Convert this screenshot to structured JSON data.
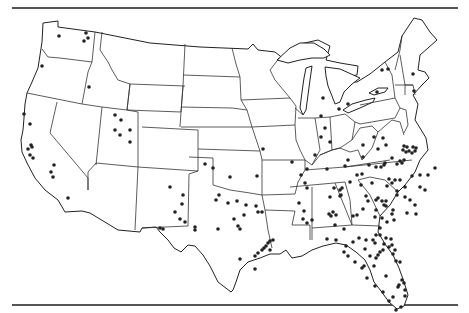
{
  "figure": {
    "type": "dot-distribution map",
    "region": "Contiguous United States",
    "marker_color": "#222222",
    "line_color": "#333333",
    "background": "#ffffff"
  },
  "points": [
    [
      59,
      36
    ],
    [
      86,
      33
    ],
    [
      88,
      38
    ],
    [
      84,
      41
    ],
    [
      42,
      66
    ],
    [
      89,
      87
    ],
    [
      24,
      114
    ],
    [
      30,
      124
    ],
    [
      31,
      145
    ],
    [
      28,
      149
    ],
    [
      32,
      147
    ],
    [
      30,
      155
    ],
    [
      33,
      158
    ],
    [
      54,
      165
    ],
    [
      51,
      172
    ],
    [
      53,
      177
    ],
    [
      68,
      198
    ],
    [
      115,
      115
    ],
    [
      121,
      120
    ],
    [
      115,
      130
    ],
    [
      120,
      135
    ],
    [
      130,
      130
    ],
    [
      130,
      142
    ],
    [
      170,
      187
    ],
    [
      183,
      195
    ],
    [
      182,
      204
    ],
    [
      175,
      212
    ],
    [
      180,
      219
    ],
    [
      163,
      229
    ],
    [
      160,
      228
    ],
    [
      205,
      164
    ],
    [
      213,
      168
    ],
    [
      230,
      177
    ],
    [
      219,
      195
    ],
    [
      216,
      200
    ],
    [
      228,
      203
    ],
    [
      237,
      201
    ],
    [
      246,
      205
    ],
    [
      256,
      206
    ],
    [
      234,
      219
    ],
    [
      244,
      215
    ],
    [
      258,
      212
    ],
    [
      262,
      212
    ],
    [
      238,
      226
    ],
    [
      240,
      229
    ],
    [
      240,
      259
    ],
    [
      255,
      256
    ],
    [
      258,
      253
    ],
    [
      262,
      250
    ],
    [
      264,
      248
    ],
    [
      266,
      246
    ],
    [
      268,
      243
    ],
    [
      270,
      241
    ],
    [
      273,
      240
    ],
    [
      270,
      250
    ],
    [
      255,
      269
    ],
    [
      195,
      230
    ],
    [
      185,
      222
    ],
    [
      195,
      227
    ],
    [
      218,
      229
    ],
    [
      263,
      149
    ],
    [
      257,
      176
    ],
    [
      307,
      169
    ],
    [
      307,
      188
    ],
    [
      299,
      203
    ],
    [
      330,
      197
    ],
    [
      340,
      196
    ],
    [
      342,
      188
    ],
    [
      341,
      195
    ],
    [
      321,
      137
    ],
    [
      315,
      155
    ],
    [
      327,
      169
    ],
    [
      305,
      183
    ],
    [
      292,
      162
    ],
    [
      301,
      175
    ],
    [
      329,
      214
    ],
    [
      331,
      216
    ],
    [
      336,
      215
    ],
    [
      333,
      212
    ],
    [
      335,
      225
    ],
    [
      344,
      229
    ],
    [
      353,
      216
    ],
    [
      357,
      215
    ],
    [
      363,
      209
    ],
    [
      368,
      201
    ],
    [
      366,
      196
    ],
    [
      376,
      200
    ],
    [
      378,
      198
    ],
    [
      382,
      201
    ],
    [
      384,
      205
    ],
    [
      386,
      201
    ],
    [
      386,
      206
    ],
    [
      392,
      214
    ],
    [
      392,
      183
    ],
    [
      357,
      175
    ],
    [
      350,
      182
    ],
    [
      361,
      185
    ],
    [
      345,
      166
    ],
    [
      348,
      160
    ],
    [
      362,
      174
    ],
    [
      363,
      157
    ],
    [
      369,
      165
    ],
    [
      381,
      167
    ],
    [
      384,
      165
    ],
    [
      385,
      163
    ],
    [
      392,
      158
    ],
    [
      402,
      163
    ],
    [
      404,
      160
    ],
    [
      397,
      164
    ],
    [
      378,
      149
    ],
    [
      383,
      138
    ],
    [
      374,
      137
    ],
    [
      363,
      145
    ],
    [
      372,
      183
    ],
    [
      389,
      179
    ],
    [
      403,
      150
    ],
    [
      406,
      152
    ],
    [
      404,
      146
    ],
    [
      407,
      147
    ],
    [
      409,
      151
    ],
    [
      413,
      147
    ],
    [
      416,
      148
    ],
    [
      412,
      153
    ],
    [
      415,
      151
    ],
    [
      400,
      161
    ],
    [
      412,
      176
    ],
    [
      405,
      187
    ],
    [
      397,
      191
    ],
    [
      395,
      180
    ],
    [
      387,
      186
    ],
    [
      376,
      167
    ],
    [
      340,
      190
    ],
    [
      334,
      188
    ],
    [
      304,
      211
    ],
    [
      303,
      219
    ],
    [
      307,
      223
    ],
    [
      312,
      220
    ],
    [
      327,
      239
    ],
    [
      336,
      240
    ],
    [
      346,
      246
    ],
    [
      353,
      242
    ],
    [
      359,
      238
    ],
    [
      366,
      240
    ],
    [
      373,
      240
    ],
    [
      376,
      235
    ],
    [
      382,
      218
    ],
    [
      387,
      222
    ],
    [
      380,
      228
    ],
    [
      384,
      244
    ],
    [
      383,
      250
    ],
    [
      362,
      268
    ],
    [
      367,
      278
    ],
    [
      374,
      266
    ],
    [
      376,
      258
    ],
    [
      370,
      256
    ],
    [
      378,
      255
    ],
    [
      380,
      252
    ],
    [
      364,
      266
    ],
    [
      376,
      210
    ],
    [
      375,
      217
    ],
    [
      393,
      210
    ],
    [
      394,
      220
    ],
    [
      410,
      200
    ],
    [
      405,
      197
    ],
    [
      420,
      187
    ],
    [
      420,
      175
    ],
    [
      428,
      175
    ],
    [
      435,
      168
    ],
    [
      425,
      190
    ],
    [
      400,
      180
    ],
    [
      397,
      195
    ],
    [
      407,
      213
    ],
    [
      415,
      205
    ],
    [
      416,
      214
    ],
    [
      380,
      235
    ],
    [
      386,
      238
    ],
    [
      389,
      247
    ],
    [
      392,
      245
    ],
    [
      395,
      250
    ],
    [
      393,
      254
    ],
    [
      396,
      261
    ],
    [
      400,
      262
    ],
    [
      386,
      276
    ],
    [
      393,
      297
    ],
    [
      398,
      287
    ],
    [
      399,
      285
    ],
    [
      402,
      280
    ],
    [
      404,
      283
    ],
    [
      405,
      290
    ],
    [
      405,
      296
    ],
    [
      401,
      307
    ],
    [
      375,
      286
    ],
    [
      383,
      292
    ],
    [
      389,
      301
    ],
    [
      396,
      310
    ],
    [
      391,
      239
    ],
    [
      375,
      243
    ],
    [
      365,
      249
    ],
    [
      348,
      256
    ],
    [
      344,
      252
    ],
    [
      355,
      262
    ],
    [
      382,
      70
    ],
    [
      388,
      69
    ],
    [
      413,
      74
    ],
    [
      377,
      92
    ],
    [
      414,
      91
    ],
    [
      323,
      98
    ],
    [
      325,
      128
    ],
    [
      321,
      116
    ],
    [
      330,
      142
    ],
    [
      386,
      145
    ],
    [
      339,
      109
    ],
    [
      348,
      104
    ]
  ]
}
